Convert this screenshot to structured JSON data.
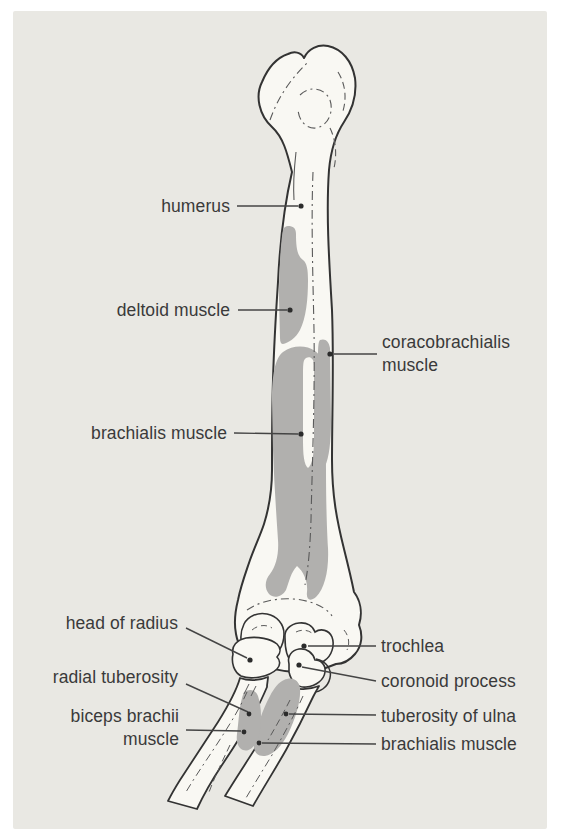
{
  "figure": {
    "colors": {
      "panel_background": "#e9e8e3",
      "bone_fill": "#f9f8f3",
      "muscle_attachment_gray": "#b1b0ae",
      "outline": "#333333",
      "label_text": "#3a3a3a",
      "leader_line": "#444444"
    },
    "labels": {
      "humerus": "humerus",
      "deltoid": "deltoid muscle",
      "coracobrachialis": "coracobrachialis muscle",
      "brachialis_shaft": "brachialis muscle",
      "head_of_radius": "head of radius",
      "trochlea": "trochlea",
      "radial_tuberosity": "radial tuberosity",
      "coronoid_process": "coronoid process",
      "biceps_brachii": "biceps brachii muscle",
      "tuberosity_of_ulna": "tuberosity of ulna",
      "brachialis_distal": "brachialis muscle"
    }
  }
}
